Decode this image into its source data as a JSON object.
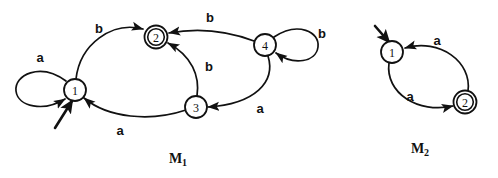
{
  "figure": {
    "title": "",
    "machines": [
      {
        "id": "M1",
        "label": "M",
        "subscript": "1",
        "label_x": 178,
        "label_y": 158,
        "states": [
          {
            "name": "1",
            "x": 75,
            "y": 90,
            "accepting": false,
            "start": true,
            "r": 11
          },
          {
            "name": "2",
            "x": 156,
            "y": 37,
            "accepting": true,
            "start": false,
            "r": 11
          },
          {
            "name": "3",
            "x": 196,
            "y": 107,
            "accepting": false,
            "start": false,
            "r": 11
          },
          {
            "name": "4",
            "x": 265,
            "y": 45,
            "accepting": false,
            "start": false,
            "r": 11
          }
        ],
        "transitions": [
          {
            "from": "1",
            "to": "1",
            "symbol": "a",
            "kind": "self-loop",
            "label_x": 40,
            "label_y": 57
          },
          {
            "from": "1",
            "to": "2",
            "symbol": "b",
            "kind": "curve",
            "label_x": 99,
            "label_y": 28
          },
          {
            "from": "4",
            "to": "2",
            "symbol": "b",
            "kind": "curve",
            "label_x": 210,
            "label_y": 17
          },
          {
            "from": "3",
            "to": "2",
            "symbol": "b",
            "kind": "curve",
            "label_x": 209,
            "label_y": 66
          },
          {
            "from": "4",
            "to": "4",
            "symbol": "b",
            "kind": "self-loop",
            "label_x": 322,
            "label_y": 33
          },
          {
            "from": "4",
            "to": "3",
            "symbol": "a",
            "kind": "curve",
            "label_x": 260,
            "label_y": 108
          },
          {
            "from": "3",
            "to": "1",
            "symbol": "a",
            "kind": "curve",
            "label_x": 120,
            "label_y": 130
          }
        ]
      },
      {
        "id": "M2",
        "label": "M",
        "subscript": "2",
        "label_x": 420,
        "label_y": 148,
        "states": [
          {
            "name": "1",
            "x": 392,
            "y": 52,
            "accepting": false,
            "start": true,
            "r": 11
          },
          {
            "name": "2",
            "x": 465,
            "y": 102,
            "accepting": true,
            "start": false,
            "r": 11
          }
        ],
        "transitions": [
          {
            "from": "2",
            "to": "1",
            "symbol": "a",
            "kind": "curve",
            "label_x": 437,
            "label_y": 40
          },
          {
            "from": "1",
            "to": "2",
            "symbol": "a",
            "kind": "curve",
            "label_x": 410,
            "label_y": 96
          }
        ]
      }
    ],
    "colors": {
      "stroke": "#111111",
      "background": "#ffffff",
      "state_fill": "#ffffff"
    }
  }
}
